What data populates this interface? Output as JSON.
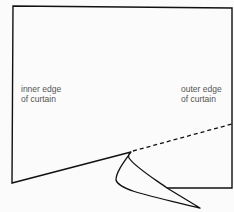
{
  "diagram": {
    "labels": {
      "inner": [
        "inner edge",
        "of curtain"
      ],
      "outer": [
        "outer edge",
        "of curtain"
      ]
    },
    "colors": {
      "line": "#111111",
      "text": "#555555",
      "background": "#fbfbfb"
    },
    "elements": [
      "curtain-outline",
      "fold-line-dashed",
      "folded-corner-flap"
    ]
  }
}
